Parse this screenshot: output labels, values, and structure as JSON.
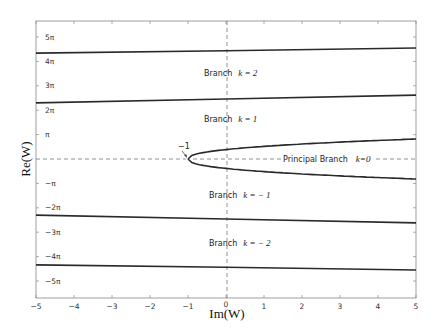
{
  "chart_data": {
    "type": "line",
    "title": "",
    "xlabel": "Im(W)",
    "ylabel": "Re(W)",
    "xlim": [
      -5,
      5
    ],
    "ylim_pi_units": [
      -5.65,
      5.65
    ],
    "grid": false,
    "legend": null,
    "x_ticks": [
      "-5",
      "-4",
      "-3",
      "-2",
      "-1",
      "0",
      "1",
      "2",
      "3",
      "4",
      "5"
    ],
    "y_ticks": [
      "5π",
      "4π",
      "3π",
      "2π",
      "π",
      "−π",
      "−2π",
      "−3π",
      "−4π",
      "−5π"
    ],
    "y_tick_values_pi": [
      5,
      4,
      3,
      2,
      1,
      -1,
      -2,
      -3,
      -4,
      -5
    ],
    "reference_lines": [
      {
        "orientation": "vertical",
        "at": 0,
        "style": "dashed"
      },
      {
        "orientation": "horizontal",
        "at": 0,
        "style": "dashed",
        "segments": [
          [
            -5,
            -1.1
          ],
          [
            3.0,
            5
          ]
        ]
      }
    ],
    "series": [
      {
        "name": "boundary k=2 upper",
        "x": [
          -5,
          0,
          5
        ],
        "y_pi": [
          4.34,
          4.44,
          4.55
        ]
      },
      {
        "name": "boundary k=1 / k=2",
        "x": [
          -5,
          0,
          5
        ],
        "y_pi": [
          2.3,
          2.46,
          2.62
        ]
      },
      {
        "name": "principal branch upper",
        "x": [
          -1,
          -0.9,
          -0.5,
          0,
          1,
          2,
          3,
          4,
          5
        ],
        "y_pi": [
          0,
          0.14,
          0.33,
          0.46,
          0.6,
          0.68,
          0.74,
          0.78,
          0.82
        ]
      },
      {
        "name": "principal branch lower",
        "x": [
          -1,
          -0.9,
          -0.5,
          0,
          1,
          2,
          3,
          4,
          5
        ],
        "y_pi": [
          0,
          -0.14,
          -0.33,
          -0.46,
          -0.6,
          -0.68,
          -0.74,
          -0.78,
          -0.82
        ]
      },
      {
        "name": "boundary k=-1 / k=-2",
        "x": [
          -5,
          0,
          5
        ],
        "y_pi": [
          -2.3,
          -2.46,
          -2.62
        ]
      },
      {
        "name": "boundary k=-2 lower",
        "x": [
          -5,
          0,
          5
        ],
        "y_pi": [
          -4.34,
          -4.44,
          -4.55
        ]
      }
    ],
    "annotations": [
      {
        "text": "Branch",
        "k_text": "k = 2",
        "x": -0.2,
        "y_pi": 3.45
      },
      {
        "text": "Branch",
        "k_text": "k = 1",
        "x": -0.2,
        "y_pi": 1.55
      },
      {
        "text": "Principal Branch",
        "k_text": "k=0",
        "x": 1.5,
        "y_pi": 0
      },
      {
        "text": "Branch",
        "k_text": "k = − 1",
        "x": -0.2,
        "y_pi": -1.55
      },
      {
        "text": "Branch",
        "k_text": "k = − 2",
        "x": -0.2,
        "y_pi": -3.45
      },
      {
        "text": "−1",
        "x": -1.15,
        "y_pi": 0.25,
        "arrow_to": [
          -1,
          0
        ]
      }
    ]
  },
  "labels": {
    "xlabel": "Im(W)",
    "ylabel": "Re(W)",
    "branch_word": "Branch",
    "principal": "Principal Branch",
    "k2": "k = 2",
    "k1": "k = 1",
    "k0": "k=0",
    "km1": "k = − 1",
    "km2": "k = − 2",
    "cusp": "−1"
  }
}
